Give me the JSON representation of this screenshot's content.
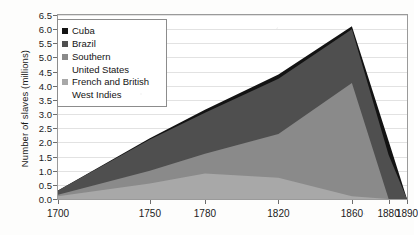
{
  "chart_data": {
    "type": "area",
    "stacked": true,
    "title": "",
    "xlabel": "",
    "ylabel": "Number of slaves (millions)",
    "x": [
      1700,
      1750,
      1780,
      1820,
      1860,
      1880,
      1890
    ],
    "xtick_labels": [
      "1700",
      "1750",
      "1780",
      "1820",
      "1860",
      "1880",
      "1890"
    ],
    "ylim": [
      0.0,
      6.5
    ],
    "ytick_labels": [
      "0.0",
      "0.5",
      "1.0",
      "1.5",
      "2.0",
      "2.5",
      "3.0",
      "3.5",
      "4.0",
      "4.5",
      "5.0",
      "5.5",
      "6.0",
      "6.5"
    ],
    "ytick_values": [
      0.0,
      0.5,
      1.0,
      1.5,
      2.0,
      2.5,
      3.0,
      3.5,
      4.0,
      4.5,
      5.0,
      5.5,
      6.0,
      6.5
    ],
    "grid": true,
    "legend_position": "top-left",
    "series": [
      {
        "name": "French and British West Indies",
        "color": "#a8a8a8",
        "values": [
          0.1,
          0.55,
          0.9,
          0.75,
          0.1,
          0.0,
          0.0
        ]
      },
      {
        "name": "Southern United States",
        "color": "#8a8a8a",
        "values": [
          0.05,
          0.45,
          0.7,
          1.55,
          4.0,
          0.0,
          0.0
        ]
      },
      {
        "name": "Brazil",
        "color": "#4f4f4f",
        "values": [
          0.15,
          1.1,
          1.45,
          1.95,
          1.9,
          1.55,
          0.0
        ]
      },
      {
        "name": "Cuba",
        "color": "#131313",
        "values": [
          0.0,
          0.05,
          0.1,
          0.15,
          0.1,
          0.5,
          0.0
        ]
      }
    ]
  },
  "legend": {
    "entries": [
      {
        "label": "Cuba",
        "continuation": "",
        "color": "#131313"
      },
      {
        "label": "Brazil",
        "continuation": "",
        "color": "#4f4f4f"
      },
      {
        "label": "Southern",
        "continuation": "United States",
        "color": "#8a8a8a"
      },
      {
        "label": "French and British",
        "continuation": "West Indies",
        "color": "#a8a8a8"
      }
    ]
  }
}
